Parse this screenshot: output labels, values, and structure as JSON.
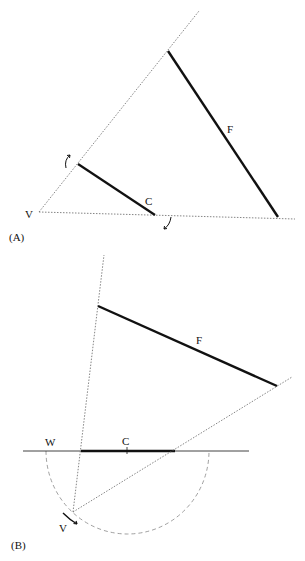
{
  "panels": [
    {
      "id": "A",
      "caption": "(A)",
      "labels": {
        "vertex": "V",
        "near_segment": "C",
        "far_segment": "F"
      }
    },
    {
      "id": "B",
      "caption": "(B)",
      "labels": {
        "vertex": "V",
        "near_segment": "C",
        "far_segment": "F",
        "circle_point": "W"
      }
    }
  ],
  "colors": {
    "ink": "#111111",
    "dotted": "#666666",
    "dashed": "#888888",
    "background": "#ffffff"
  }
}
